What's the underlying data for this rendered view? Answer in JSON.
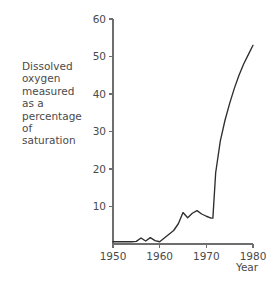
{
  "chart_data": {
    "type": "line",
    "title": "",
    "ylabel": "Dissolved\noxygen\nmeasured\nas a\npercentage of\nsaturation",
    "xlabel": "Year",
    "xlim": [
      1950,
      1980
    ],
    "ylim": [
      0,
      60
    ],
    "xticks": [
      1950,
      1960,
      1970,
      1980
    ],
    "xtick_labels": [
      "1950",
      "1960",
      "1970",
      "1980"
    ],
    "yticks": [
      10,
      20,
      30,
      40,
      50,
      60
    ],
    "ytick_labels": [
      "10",
      "20",
      "30",
      "40",
      "50",
      "60"
    ],
    "grid": false,
    "legend": "none",
    "series": [
      {
        "name": "Dissolved oxygen",
        "x": [
          1950,
          1951,
          1952,
          1953,
          1954,
          1955,
          1956,
          1957,
          1958,
          1959,
          1960,
          1961,
          1962,
          1963,
          1964,
          1965,
          1966,
          1967,
          1968,
          1969,
          1970,
          1971,
          1971.4,
          1972,
          1973,
          1974,
          1975,
          1976,
          1977,
          1978,
          1979,
          1980
        ],
        "values": [
          0.6,
          0.6,
          0.6,
          0.6,
          0.6,
          0.7,
          1.6,
          0.8,
          1.7,
          0.9,
          0.6,
          1.6,
          2.6,
          3.6,
          5.4,
          8.4,
          7.0,
          8.2,
          8.9,
          8.0,
          7.4,
          6.9,
          6.9,
          19.0,
          27.5,
          33.0,
          37.5,
          41.5,
          45.0,
          48.0,
          50.5,
          53.0
        ]
      }
    ],
    "colors": {
      "line": "#2e2e2e",
      "axis": "#6e6e6e",
      "text": "#4a4a4a",
      "background": "#ffffff"
    },
    "geometry": {
      "plot_left": 113,
      "plot_right": 253,
      "plot_bottom": 244,
      "plot_top": 19
    }
  }
}
